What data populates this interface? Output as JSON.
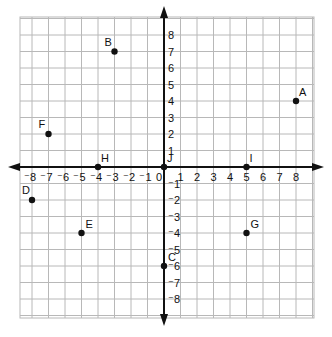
{
  "diagram": {
    "type": "coordinate-plane",
    "x_range": [
      -8,
      8
    ],
    "y_range": [
      -8,
      8
    ],
    "origin_label": "0",
    "x_ticks": [
      -8,
      -7,
      -6,
      -5,
      -4,
      -3,
      -2,
      -1,
      1,
      2,
      3,
      4,
      5,
      6,
      7,
      8
    ],
    "y_ticks": [
      -8,
      -7,
      -6,
      -5,
      -4,
      -3,
      -2,
      -1,
      1,
      2,
      3,
      4,
      5,
      6,
      7,
      8
    ],
    "points": [
      {
        "label": "A",
        "x": 8,
        "y": 4
      },
      {
        "label": "B",
        "x": -3,
        "y": 7
      },
      {
        "label": "C",
        "x": 0,
        "y": -6
      },
      {
        "label": "D",
        "x": -8,
        "y": -2
      },
      {
        "label": "E",
        "x": -5,
        "y": -4
      },
      {
        "label": "F",
        "x": -7,
        "y": 2
      },
      {
        "label": "G",
        "x": 5,
        "y": -4
      },
      {
        "label": "H",
        "x": -4,
        "y": 0
      },
      {
        "label": "I",
        "x": 5,
        "y": 0
      },
      {
        "label": "J",
        "x": 0,
        "y": 0
      }
    ],
    "colors": {
      "grid": "#b8b8b8",
      "axis": "#111111",
      "point": "#111111"
    }
  }
}
